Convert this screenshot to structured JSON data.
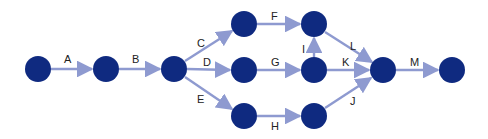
{
  "diagram": {
    "type": "activity-on-arrow network",
    "colors": {
      "node": "#0f2a80",
      "edge": "#8e9ad0",
      "label": "#222222"
    },
    "nodes": [
      {
        "id": "n1",
        "x": 38,
        "y": 69
      },
      {
        "id": "n2",
        "x": 106,
        "y": 69
      },
      {
        "id": "n3",
        "x": 174,
        "y": 69
      },
      {
        "id": "n4",
        "x": 244,
        "y": 24
      },
      {
        "id": "n5",
        "x": 244,
        "y": 70
      },
      {
        "id": "n6",
        "x": 244,
        "y": 116
      },
      {
        "id": "n7",
        "x": 314,
        "y": 24
      },
      {
        "id": "n8",
        "x": 314,
        "y": 70
      },
      {
        "id": "n9",
        "x": 314,
        "y": 116
      },
      {
        "id": "n10",
        "x": 383,
        "y": 70
      },
      {
        "id": "n11",
        "x": 452,
        "y": 70
      }
    ],
    "edges": [
      {
        "label": "A",
        "from": "n1",
        "to": "n2"
      },
      {
        "label": "B",
        "from": "n2",
        "to": "n3"
      },
      {
        "label": "C",
        "from": "n3",
        "to": "n4"
      },
      {
        "label": "D",
        "from": "n3",
        "to": "n5"
      },
      {
        "label": "E",
        "from": "n3",
        "to": "n6"
      },
      {
        "label": "F",
        "from": "n4",
        "to": "n7"
      },
      {
        "label": "G",
        "from": "n5",
        "to": "n8"
      },
      {
        "label": "H",
        "from": "n6",
        "to": "n9"
      },
      {
        "label": "I",
        "from": "n8",
        "to": "n7"
      },
      {
        "label": "J",
        "from": "n9",
        "to": "n10"
      },
      {
        "label": "K",
        "from": "n8",
        "to": "n10"
      },
      {
        "label": "L",
        "from": "n7",
        "to": "n10"
      },
      {
        "label": "M",
        "from": "n10",
        "to": "n11"
      }
    ],
    "labels": {
      "A": "A",
      "B": "B",
      "C": "C",
      "D": "D",
      "E": "E",
      "F": "F",
      "G": "G",
      "H": "H",
      "I": "I",
      "J": "J",
      "K": "K",
      "L": "L",
      "M": "M"
    }
  }
}
